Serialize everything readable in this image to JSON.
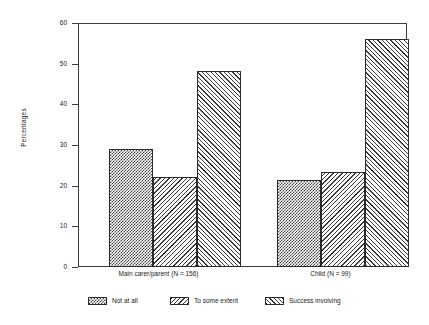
{
  "chart_data": {
    "type": "bar",
    "title": "",
    "subtitle": "",
    "xlabel": "",
    "ylabel": "Percentages",
    "ylim": [
      0,
      60
    ],
    "yticks": [
      0,
      10,
      20,
      30,
      40,
      50,
      60
    ],
    "ytick_labels": [
      "0",
      "10",
      "20",
      "30",
      "40",
      "50",
      "60"
    ],
    "grid": false,
    "legend_position": "bottom",
    "categories": [
      "Main carer/parent (N = 156)",
      "Child (N = 99)"
    ],
    "series": [
      {
        "name": "Not at all",
        "pattern": "checkerboard",
        "values": [
          29.2,
          21.4
        ]
      },
      {
        "name": "To some extent",
        "pattern": "backslash-hatch",
        "values": [
          22.2,
          23.5
        ]
      },
      {
        "name": "Success involving",
        "pattern": "forwardslash-hatch",
        "values": [
          48.3,
          56.3
        ]
      }
    ]
  },
  "axis": {
    "y_title": "Percentages"
  },
  "legend": {
    "items": [
      {
        "label": "Not at all"
      },
      {
        "label": "To some extent"
      },
      {
        "label": "Success involving"
      }
    ]
  },
  "colors": {
    "frame": "#3c3c3c",
    "bar_outline": "#2b2b2b",
    "hatch": "#3a3a3a",
    "background": "#ffffff",
    "text": "#222222"
  }
}
